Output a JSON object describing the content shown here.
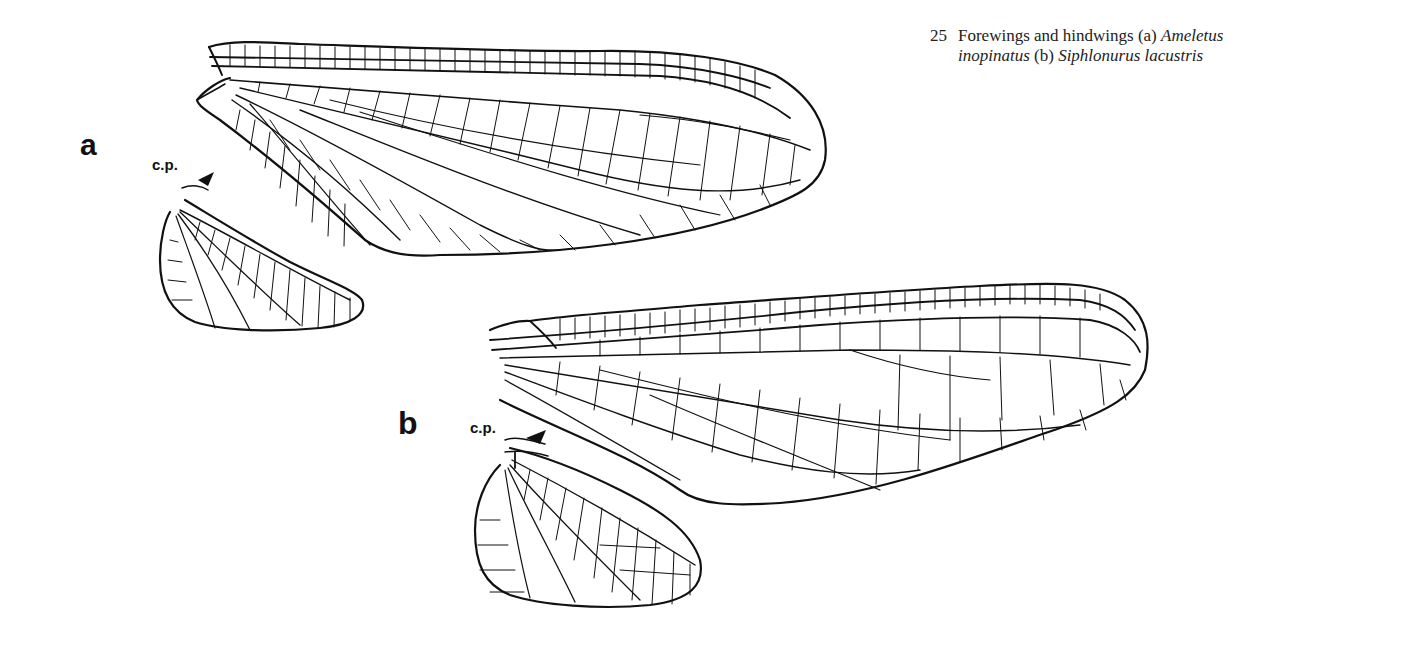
{
  "figure": {
    "number": "25",
    "caption_line1_prefix": "Forewings and hindwings (a) ",
    "caption_line1_italic": "Ameletus",
    "caption_line2_italic1": "inopinatus",
    "caption_line2_mid": " (b) ",
    "caption_line2_italic2": "Siphlonurus lacustris"
  },
  "panels": {
    "a": {
      "label": "a",
      "annotation": "c.p.",
      "species": "Ameletus inopinatus"
    },
    "b": {
      "label": "b",
      "annotation": "c.p.",
      "species": "Siphlonurus lacustris"
    }
  },
  "colors": {
    "ink": "#111111",
    "background": "#ffffff"
  }
}
